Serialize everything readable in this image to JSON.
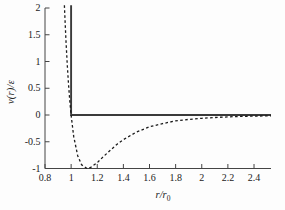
{
  "figure": {
    "ylabel": "v(r)/ε",
    "xlabel_main": "r/r",
    "xlabel_sub": "0",
    "background": "#fdfdfd",
    "axis_color": "#444444"
  },
  "chart_data": {
    "type": "line",
    "title": "",
    "xlabel": "r/r0",
    "ylabel": "v(r)/ε",
    "xlim": [
      0.8,
      2.53
    ],
    "ylim": [
      -1,
      2
    ],
    "grid": false,
    "legend": "none",
    "xticks": [
      0.8,
      1,
      1.2,
      1.4,
      1.6,
      1.8,
      2,
      2.2,
      2.4
    ],
    "xtick_labels": [
      "0.8",
      "1",
      "1.2",
      "1.4",
      "1.6",
      "1.8",
      "2",
      "2.2",
      "2.4"
    ],
    "yticks": [
      2,
      1.5,
      1,
      0.5,
      0,
      -0.5,
      -1
    ],
    "ytick_labels": [
      "2",
      "1.5",
      "1",
      "0.5",
      "0",
      "-0.5",
      "-1"
    ],
    "series": [
      {
        "name": "hard-sphere potential (solid)",
        "style": "solid",
        "color": "#3a3a3a",
        "width": 1.9,
        "points": [
          [
            1,
            2.05
          ],
          [
            1,
            0
          ],
          [
            2.53,
            0
          ]
        ]
      },
      {
        "name": "Lennard-Jones potential (dashed)",
        "style": "dashed",
        "color": "#1c1c1c",
        "width": 1.3,
        "points": [
          [
            0.9485,
            2.05
          ],
          [
            0.95,
            1.96
          ],
          [
            0.96,
            1.42
          ],
          [
            0.97,
            0.96
          ],
          [
            0.98,
            0.58
          ],
          [
            0.99,
            0.26
          ],
          [
            1.0,
            0.0
          ],
          [
            1.02,
            -0.4
          ],
          [
            1.05,
            -0.76
          ],
          [
            1.08,
            -0.93
          ],
          [
            1.1225,
            -1.0
          ],
          [
            1.15,
            -0.98
          ],
          [
            1.2,
            -0.89
          ],
          [
            1.25,
            -0.77
          ],
          [
            1.3,
            -0.66
          ],
          [
            1.35,
            -0.55
          ],
          [
            1.4,
            -0.46
          ],
          [
            1.5,
            -0.32
          ],
          [
            1.6,
            -0.22
          ],
          [
            1.7,
            -0.16
          ],
          [
            1.8,
            -0.11
          ],
          [
            1.9,
            -0.083
          ],
          [
            2.0,
            -0.062
          ],
          [
            2.1,
            -0.046
          ],
          [
            2.2,
            -0.035
          ],
          [
            2.3,
            -0.027
          ],
          [
            2.4,
            -0.021
          ],
          [
            2.5,
            -0.016
          ],
          [
            2.53,
            -0.015
          ]
        ]
      }
    ]
  }
}
